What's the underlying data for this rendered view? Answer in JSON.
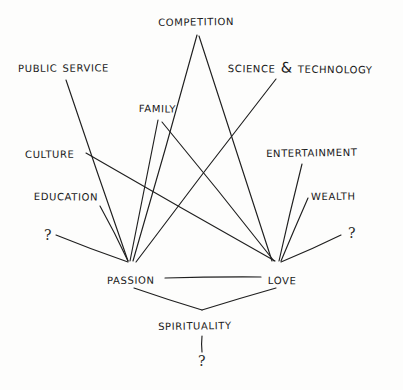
{
  "diagram": {
    "style": "hand-drawn ink on paper",
    "background_color": "#fdfdfc",
    "ink_color": "#1f1f1f",
    "core_nodes": [
      {
        "id": "passion",
        "label": "Passion",
        "x": 107,
        "y": 272
      },
      {
        "id": "love",
        "label": "Love",
        "x": 268,
        "y": 272
      },
      {
        "id": "spirituality",
        "label": "Spirituality",
        "x": 158,
        "y": 318
      }
    ],
    "source_nodes": [
      {
        "id": "competition",
        "label": "Competition",
        "x": 158,
        "y": 14
      },
      {
        "id": "public_service",
        "label": "Public Service",
        "x": 18,
        "y": 60
      },
      {
        "id": "science_technology",
        "label": "Science & Technology",
        "x": 228,
        "y": 60
      },
      {
        "id": "family",
        "label": "Family",
        "x": 139,
        "y": 100
      },
      {
        "id": "culture",
        "label": "Culture",
        "x": 25,
        "y": 146
      },
      {
        "id": "entertainment",
        "label": "Entertainment",
        "x": 266,
        "y": 145
      },
      {
        "id": "education",
        "label": "Education",
        "x": 34,
        "y": 188
      },
      {
        "id": "wealth",
        "label": "Wealth",
        "x": 311,
        "y": 188
      }
    ],
    "unknown_markers": [
      {
        "id": "unknown-left",
        "label": "?",
        "x": 44,
        "y": 228
      },
      {
        "id": "unknown-right",
        "label": "?",
        "x": 348,
        "y": 226
      },
      {
        "id": "unknown-bottom",
        "label": "?",
        "x": 198,
        "y": 354
      }
    ],
    "hub_points": {
      "passion_hub": {
        "x": 128,
        "y": 263
      },
      "love_hub": {
        "x": 277,
        "y": 263
      },
      "spirituality_vertex": {
        "x": 202,
        "y": 310
      }
    },
    "edges": [
      {
        "id": "public-service-to-passion",
        "from": "public_service",
        "to": "passion_hub",
        "x1": 66,
        "y1": 80,
        "x2": 128,
        "y2": 261
      },
      {
        "id": "culture-to-love",
        "from": "culture",
        "to": "love_hub",
        "x1": 86,
        "y1": 153,
        "x2": 275,
        "y2": 261
      },
      {
        "id": "education-to-passion",
        "from": "education",
        "to": "passion_hub",
        "x1": 100,
        "y1": 206,
        "x2": 128,
        "y2": 261
      },
      {
        "id": "unknown-left-to-passion",
        "from": "unknown-left",
        "to": "passion_hub",
        "x1": 56,
        "y1": 235,
        "x2": 128,
        "y2": 262
      },
      {
        "id": "family-to-passion",
        "from": "family",
        "to": "passion_hub",
        "x1": 158,
        "y1": 120,
        "x2": 130,
        "y2": 261
      },
      {
        "id": "competition-to-passion",
        "from": "competition",
        "to": "passion_hub",
        "x1": 197,
        "y1": 35,
        "x2": 133,
        "y2": 261
      },
      {
        "id": "science-tech-to-passion",
        "from": "science_technology",
        "to": "passion_hub",
        "x1": 276,
        "y1": 79,
        "x2": 136,
        "y2": 262
      },
      {
        "id": "competition-to-love",
        "from": "competition",
        "to": "love_hub",
        "x1": 199,
        "y1": 36,
        "x2": 272,
        "y2": 261
      },
      {
        "id": "family-to-love",
        "from": "family",
        "to": "love_hub",
        "x1": 162,
        "y1": 122,
        "x2": 274,
        "y2": 261
      },
      {
        "id": "entertainment-to-love",
        "from": "entertainment",
        "to": "love_hub",
        "x1": 302,
        "y1": 164,
        "x2": 279,
        "y2": 261
      },
      {
        "id": "wealth-to-love",
        "from": "wealth",
        "to": "love_hub",
        "x1": 308,
        "y1": 198,
        "x2": 281,
        "y2": 261
      },
      {
        "id": "unknown-right-to-love",
        "from": "unknown-right",
        "to": "love_hub",
        "x1": 341,
        "y1": 235,
        "x2": 281,
        "y2": 262
      },
      {
        "id": "passion-to-love",
        "from": "passion",
        "to": "love",
        "x1": 165,
        "y1": 278,
        "x2": 261,
        "y2": 277
      },
      {
        "id": "passion-to-spirituality",
        "from": "passion",
        "to": "spirituality_vertex",
        "x1": 134,
        "y1": 288,
        "x2": 202,
        "y2": 310
      },
      {
        "id": "love-to-spirituality",
        "from": "love",
        "to": "spirituality_vertex",
        "x1": 276,
        "y1": 288,
        "x2": 202,
        "y2": 310
      },
      {
        "id": "spirituality-to-unknown",
        "from": "spirituality",
        "to": "unknown-bottom",
        "x1": 202,
        "y1": 336,
        "x2": 202,
        "y2": 352
      }
    ]
  }
}
